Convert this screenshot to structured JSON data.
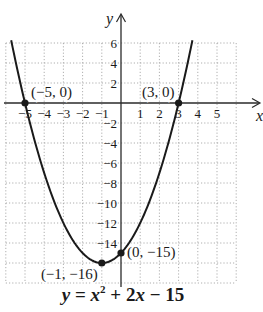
{
  "chart_data": {
    "type": "line",
    "title": "",
    "caption": {
      "lhs": "y",
      "eq": "=",
      "term1_base": "x",
      "term1_exp": "2",
      "op1": "+",
      "term2": "2x",
      "op2": "−",
      "const": "15"
    },
    "function": "y = x^2 + 2x - 15",
    "xlabel": "x",
    "ylabel": "y",
    "xlim": [
      -6,
      6
    ],
    "ylim": [
      -18,
      6
    ],
    "grid": true,
    "grid_style": "dotted",
    "x_ticks": [
      {
        "value": -5,
        "label": "−5"
      },
      {
        "value": -4,
        "label": "−4"
      },
      {
        "value": -3,
        "label": "−3"
      },
      {
        "value": -2,
        "label": "−2"
      },
      {
        "value": -1,
        "label": "−1"
      },
      {
        "value": 1,
        "label": "1"
      },
      {
        "value": 2,
        "label": "2"
      },
      {
        "value": 3,
        "label": "3"
      },
      {
        "value": 4,
        "label": "4"
      },
      {
        "value": 5,
        "label": "5"
      }
    ],
    "y_ticks": [
      {
        "value": 6,
        "label": "6"
      },
      {
        "value": 4,
        "label": "4"
      },
      {
        "value": 2,
        "label": "2"
      },
      {
        "value": -2,
        "label": "−2"
      },
      {
        "value": -4,
        "label": "−4"
      },
      {
        "value": -6,
        "label": "−6"
      },
      {
        "value": -8,
        "label": "−8"
      },
      {
        "value": -10,
        "label": "−10"
      },
      {
        "value": -12,
        "label": "−12"
      },
      {
        "value": -14,
        "label": "−14"
      }
    ],
    "points": [
      {
        "x": -5,
        "y": 0,
        "label": "(−5, 0)"
      },
      {
        "x": 3,
        "y": 0,
        "label": "(3, 0)"
      },
      {
        "x": 0,
        "y": -15,
        "label": "(0, −15)"
      },
      {
        "x": -1,
        "y": -16,
        "label": "(−1, −16)"
      }
    ],
    "curve_domain": [
      -5.72,
      3.72
    ],
    "colors": {
      "curve": "#1a1a1a",
      "axis": "#2a2a2a",
      "grid": "#9a9a9a",
      "text": "#1a1a1a"
    }
  }
}
